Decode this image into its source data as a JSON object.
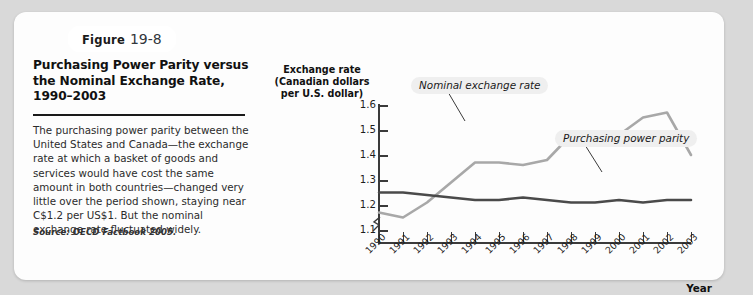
{
  "figure": {
    "tag_word": "Figure",
    "tag_number": "19-8",
    "title": "Purchasing Power Parity versus the Nominal Exchange Rate, 1990–2003",
    "body": "The purchasing power parity between the United States and Canada—the exchange rate at which a basket of goods and services would have cost the same amount in both countries—changed very little over the period shown, staying near C$1.2 per US$1. But the nominal exchange rate fluctuated widely.",
    "source": "Source: OECD Factbook 2005."
  },
  "colors": {
    "nominal_line": "#a8a8a8",
    "ppp_line": "#4a4a4a",
    "axis": "#3b3b3b",
    "card_background": "#fdfdfd",
    "page_background": "#d9d9d9",
    "label_background": "#efefef"
  },
  "chart_data": {
    "type": "line",
    "title": "",
    "xlabel": "Year",
    "ylabel": "Exchange rate (Canadian dollars per U.S. dollar)",
    "ylabel_lines": [
      "Exchange rate",
      "(Canadian dollars",
      "per U.S. dollar)"
    ],
    "categories": [
      "1990",
      "1991",
      "1992",
      "1993",
      "1994",
      "1995",
      "1996",
      "1997",
      "1998",
      "1999",
      "2000",
      "2001",
      "2002",
      "2003"
    ],
    "x": [
      1990,
      1991,
      1992,
      1993,
      1994,
      1995,
      1996,
      1997,
      1998,
      1999,
      2000,
      2001,
      2002,
      2003
    ],
    "ylim": [
      1.1,
      1.6
    ],
    "yticks": [
      1.1,
      1.2,
      1.3,
      1.4,
      1.5,
      1.6
    ],
    "ytick_labels": [
      "1.1",
      "1.2",
      "1.3",
      "1.4",
      "1.5",
      "1.6"
    ],
    "axis_break": true,
    "grid": false,
    "legend": "inline-annotations",
    "series": [
      {
        "name": "Nominal exchange rate",
        "color": "#a8a8a8",
        "values": [
          1.17,
          1.15,
          1.21,
          1.29,
          1.37,
          1.37,
          1.36,
          1.38,
          1.48,
          1.49,
          1.48,
          1.55,
          1.57,
          1.4
        ]
      },
      {
        "name": "Purchasing power parity",
        "color": "#4a4a4a",
        "values": [
          1.25,
          1.25,
          1.24,
          1.23,
          1.22,
          1.22,
          1.23,
          1.22,
          1.21,
          1.21,
          1.22,
          1.21,
          1.22,
          1.22
        ]
      }
    ],
    "annotations": [
      {
        "text": "Nominal exchange rate",
        "points_to_year": 1995
      },
      {
        "text": "Purchasing power parity",
        "points_to_year": 2001
      }
    ]
  }
}
